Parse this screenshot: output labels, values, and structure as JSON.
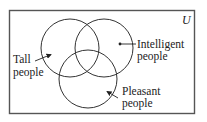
{
  "diagram": {
    "type": "venn",
    "universe_label": "U",
    "sets": [
      {
        "id": "tall",
        "label_line1": "Tall",
        "label_line2": "people"
      },
      {
        "id": "intelligent",
        "label_line1": "Intelligent",
        "label_line2": "people"
      },
      {
        "id": "pleasant",
        "label_line1": "Pleasant",
        "label_line2": "people"
      }
    ],
    "colors": {
      "stroke": "#333333",
      "text": "#222222",
      "background": "#ffffff"
    }
  }
}
